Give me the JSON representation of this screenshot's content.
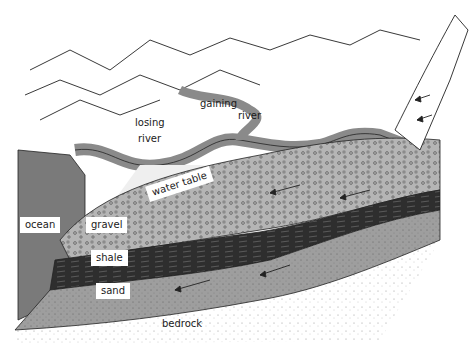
{
  "diagram": {
    "labels": {
      "gaining_river": [
        "gaining",
        "river"
      ],
      "losing_river": [
        "losing",
        "river"
      ],
      "water_table": "water table",
      "ocean": "ocean",
      "gravel": "gravel",
      "shale": "shale",
      "sand": "sand",
      "bedrock": "bedrock"
    },
    "colors": {
      "ocean": "#7a7a7a",
      "river": "#8a8a8a",
      "gravel": "#b8b8b8",
      "shale": "#2e2e2e",
      "sand": "#9c9c9c",
      "bedrock": "#f4f4f4",
      "unsaturated": "#efefef",
      "outline": "#222222"
    }
  }
}
